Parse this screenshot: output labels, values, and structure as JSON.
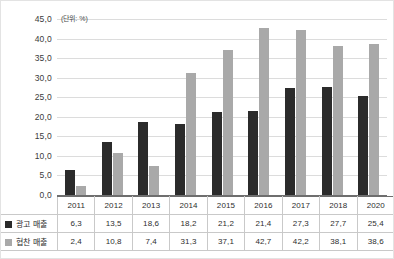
{
  "chart_data": {
    "type": "bar",
    "title": "",
    "unit_note": "(단위: %)",
    "xlabel": "",
    "ylabel": "",
    "ylim": [
      0,
      45
    ],
    "ytick_step": 5,
    "yticks": [
      "0,0",
      "5,0",
      "10,0",
      "15,0",
      "20,0",
      "25,0",
      "30,0",
      "35,0",
      "40,0",
      "45,0"
    ],
    "grid": true,
    "legend_position": "table-below",
    "categories": [
      "2011",
      "2012",
      "2013",
      "2014",
      "2015",
      "2016",
      "2017",
      "2018",
      "2020"
    ],
    "series": [
      {
        "name": "광고 매출",
        "color": "#2b2b2b",
        "values": [
          6.3,
          13.5,
          18.6,
          18.2,
          21.2,
          21.4,
          27.3,
          27.7,
          25.4
        ],
        "labels": [
          "6,3",
          "13,5",
          "18,6",
          "18,2",
          "21,2",
          "21,4",
          "27,3",
          "27,7",
          "25,4"
        ]
      },
      {
        "name": "협찬 매출",
        "color": "#a9a9a9",
        "values": [
          2.4,
          10.8,
          7.4,
          31.3,
          37.1,
          42.7,
          42.2,
          38.1,
          38.6
        ],
        "labels": [
          "2,4",
          "10,8",
          "7,4",
          "31,3",
          "37,1",
          "42,7",
          "42,2",
          "38,1",
          "38,6"
        ]
      }
    ]
  }
}
